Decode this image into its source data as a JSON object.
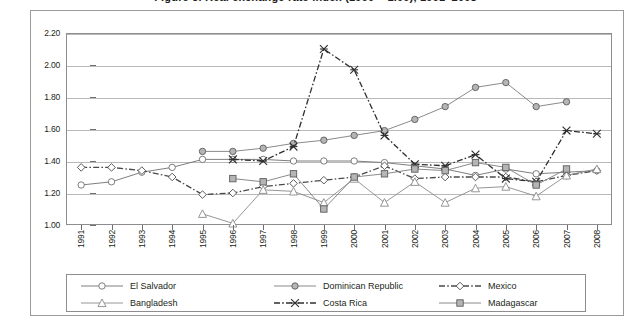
{
  "title": "Figure 3. Real exchange rate index (1990 = 1.00), 1991–2008",
  "chart_data": {
    "type": "line",
    "title": "Figure 3. Real exchange rate index (1990 = 1.00), 1991–2008",
    "xlabel": "",
    "ylabel": "",
    "ylim": [
      1.0,
      2.2
    ],
    "ytick_step": 0.2,
    "grid": true,
    "legend_position": "bottom",
    "categories": [
      "1991",
      "1992",
      "1993",
      "1994",
      "1995",
      "1996",
      "1997",
      "1998",
      "1999",
      "2000",
      "2001",
      "2002",
      "2003",
      "2004",
      "2005",
      "2006",
      "2007",
      "2008"
    ],
    "yticks": [
      "1.00",
      "1.20",
      "1.40",
      "1.60",
      "1.80",
      "2.00",
      "2.20"
    ],
    "series": [
      {
        "name": "El Salvador",
        "marker": "circle-open",
        "line": "solid",
        "color": "#6f6f6f",
        "values": [
          1.25,
          1.27,
          1.33,
          1.36,
          1.41,
          1.41,
          1.41,
          1.4,
          1.4,
          1.4,
          1.39,
          1.37,
          1.35,
          1.31,
          1.35,
          1.32,
          1.33,
          1.34
        ]
      },
      {
        "name": "Dominican Republic",
        "marker": "circle-filled",
        "line": "solid",
        "color": "#7d7d7d",
        "values": [
          null,
          null,
          null,
          null,
          1.46,
          1.46,
          1.48,
          1.51,
          1.53,
          1.56,
          1.59,
          1.66,
          1.74,
          1.86,
          1.89,
          1.74,
          1.77,
          null
        ]
      },
      {
        "name": "Mexico",
        "marker": "diamond-open",
        "line": "dash-dot",
        "color": "#4a4a4a",
        "values": [
          1.36,
          1.36,
          1.34,
          1.3,
          1.19,
          1.2,
          1.24,
          1.26,
          1.28,
          1.3,
          1.37,
          1.29,
          1.3,
          1.3,
          1.3,
          1.27,
          1.31,
          1.34
        ]
      },
      {
        "name": "Bangladesh",
        "marker": "triangle-open",
        "line": "solid",
        "color": "#8a8a8a",
        "values": [
          null,
          null,
          null,
          null,
          1.07,
          1.01,
          1.22,
          1.21,
          1.14,
          1.29,
          1.14,
          1.27,
          1.14,
          1.23,
          1.24,
          1.18,
          1.31,
          1.35
        ]
      },
      {
        "name": "Costa Rica",
        "marker": "x",
        "line": "dash-dot",
        "color": "#2f2f2f",
        "values": [
          null,
          null,
          null,
          null,
          null,
          1.41,
          1.4,
          1.49,
          2.1,
          1.97,
          1.56,
          1.38,
          1.37,
          1.44,
          1.29,
          1.27,
          1.59,
          1.57
        ]
      },
      {
        "name": "Madagascar",
        "marker": "square-filled",
        "line": "solid",
        "color": "#7d7d7d",
        "values": [
          null,
          null,
          null,
          null,
          null,
          1.29,
          1.27,
          1.32,
          1.1,
          1.3,
          1.32,
          1.35,
          1.34,
          1.39,
          1.36,
          1.25,
          1.35,
          null
        ]
      }
    ]
  },
  "legend": {
    "entries": [
      {
        "label": "El Salvador",
        "marker": "circle-open",
        "line": "solid"
      },
      {
        "label": "Dominican Republic",
        "marker": "circle-filled",
        "line": "solid"
      },
      {
        "label": "Mexico",
        "marker": "diamond-open",
        "line": "dash-dot"
      },
      {
        "label": "Bangladesh",
        "marker": "triangle-open",
        "line": "solid"
      },
      {
        "label": "Costa Rica",
        "marker": "x",
        "line": "dash-dot"
      },
      {
        "label": "Madagascar",
        "marker": "square-filled",
        "line": "solid"
      }
    ]
  },
  "colors": {
    "grid": "#b9b9b9",
    "axis": "#8d8d8d",
    "frame": "#9a9a9a",
    "text": "#231f20",
    "background": "#ffffff"
  }
}
